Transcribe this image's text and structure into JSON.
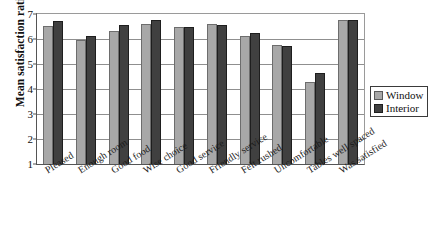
{
  "chart_data": {
    "type": "bar",
    "title": "",
    "xlabel": "",
    "ylabel": "Mean satisfaction ratings",
    "ylim": [
      1,
      7
    ],
    "yticks": [
      1,
      2,
      3,
      4,
      5,
      6,
      7
    ],
    "grid": true,
    "legend_position": "right",
    "categories": [
      "Pleased",
      "Enough room",
      "Good food",
      "Wise choice",
      "Good service",
      "Friendly service",
      "Felt rushed",
      "Uncomfortable",
      "Tables well spaced",
      "Was satisfied"
    ],
    "series": [
      {
        "name": "Window",
        "color": "#a8a8a8",
        "values": [
          6.52,
          5.95,
          6.32,
          6.6,
          6.49,
          6.62,
          6.14,
          5.76,
          4.28,
          6.76
        ]
      },
      {
        "name": "Interior",
        "color": "#404040",
        "values": [
          6.72,
          6.13,
          6.55,
          6.78,
          6.5,
          6.58,
          6.24,
          5.72,
          4.65,
          6.76
        ]
      }
    ]
  },
  "legend": {
    "items": [
      {
        "label": "Window"
      },
      {
        "label": "Interior"
      }
    ]
  },
  "axis": {
    "y_title": "Mean satisfaction ratings"
  }
}
